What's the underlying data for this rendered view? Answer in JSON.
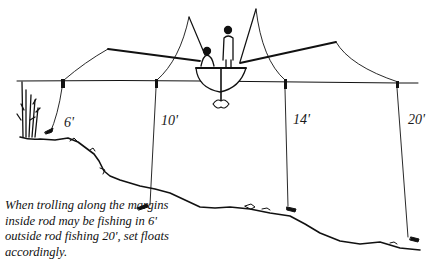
{
  "diagram": {
    "depth_labels": [
      {
        "id": "rod-1",
        "label": "6'",
        "x": 64,
        "y": 120
      },
      {
        "id": "rod-2",
        "label": "10'",
        "x": 161,
        "y": 117
      },
      {
        "id": "rod-3",
        "label": "14'",
        "x": 293,
        "y": 116
      },
      {
        "id": "rod-4",
        "label": "20'",
        "x": 408,
        "y": 116
      }
    ],
    "caption": "When trolling along the margins inside rod may be fishing in 6' outside rod fishing 20', set floats accordingly.",
    "colors": {
      "ink": "#111111",
      "background": "#ffffff"
    }
  }
}
